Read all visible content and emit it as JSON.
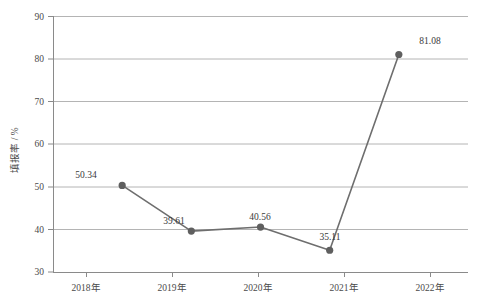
{
  "chart_data": {
    "type": "line",
    "title": "",
    "xlabel": "",
    "ylabel": "填报率 / %",
    "categories": [
      "2018年",
      "2019年",
      "2020年",
      "2021年",
      "2022年"
    ],
    "values": [
      50.34,
      39.61,
      40.56,
      35.11,
      81.08
    ],
    "point_labels": [
      "50.34",
      "39.61",
      "40.56",
      "35.11",
      "81.08"
    ],
    "ylim": [
      30,
      90
    ],
    "ytick_values": [
      30,
      40,
      50,
      60,
      70,
      80,
      90
    ],
    "ytick_labels": [
      "30",
      "40",
      "50",
      "60",
      "70",
      "80",
      "90"
    ],
    "grid": "horizontal",
    "legend": "none",
    "series": [
      {
        "name": "填报率",
        "values": [
          50.34,
          39.61,
          40.56,
          35.11,
          81.08
        ]
      }
    ],
    "colors": {
      "line": "#6e6e6e",
      "marker": "#5f5f5f",
      "grid": "#b0b0b0",
      "axis": "#808080",
      "text": "#3a3a3a",
      "background": "#ffffff"
    }
  }
}
